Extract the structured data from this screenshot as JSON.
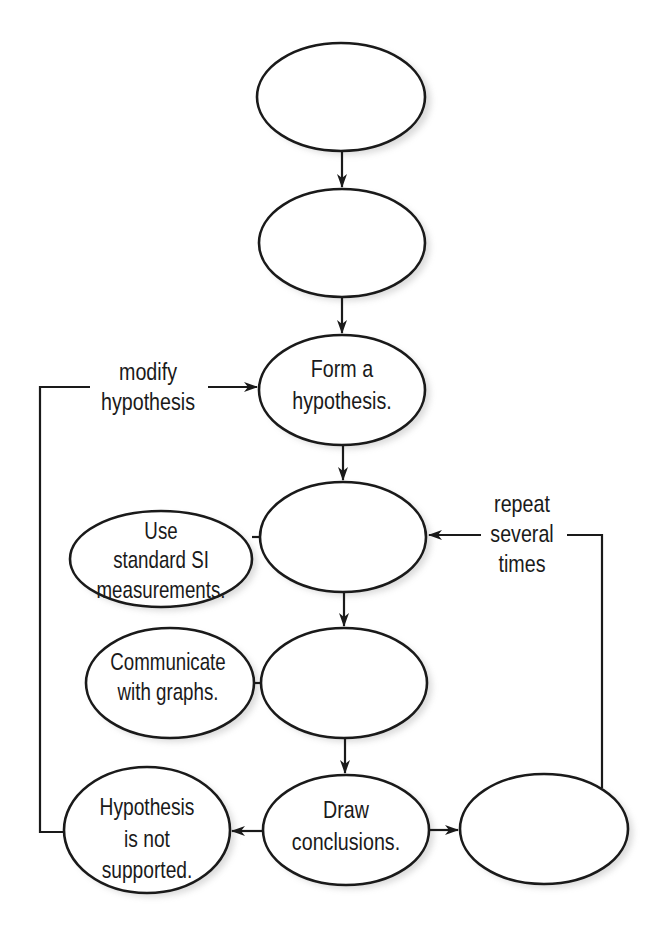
{
  "diagram": {
    "type": "flowchart",
    "colors": {
      "stroke": "#1a1a1a",
      "fill": "#ffffff",
      "background": "#ffffff"
    },
    "nodes": [
      {
        "id": "n1",
        "lines": [],
        "blank": true
      },
      {
        "id": "n2",
        "lines": [],
        "blank": true
      },
      {
        "id": "n3",
        "lines": [
          "Form a",
          "hypothesis."
        ]
      },
      {
        "id": "n4",
        "lines": [],
        "blank": true
      },
      {
        "id": "n5",
        "lines": [],
        "blank": true
      },
      {
        "id": "n6",
        "lines": [
          "Draw",
          "conclusions."
        ]
      },
      {
        "id": "n7",
        "lines": [],
        "blank": true
      },
      {
        "id": "side_si",
        "lines": [
          "Use",
          "standard SI",
          "measurements."
        ]
      },
      {
        "id": "side_graphs",
        "lines": [
          "Communicate",
          "with graphs."
        ]
      },
      {
        "id": "not_supported",
        "lines": [
          "Hypothesis",
          "is not",
          "supported."
        ]
      }
    ],
    "edge_labels": {
      "modify": [
        "modify",
        "hypothesis"
      ],
      "repeat": [
        "repeat",
        "several",
        "times"
      ]
    },
    "edges": [
      {
        "from": "n1",
        "to": "n2"
      },
      {
        "from": "n2",
        "to": "n3"
      },
      {
        "from": "n3",
        "to": "n4"
      },
      {
        "from": "n4",
        "to": "n5"
      },
      {
        "from": "n5",
        "to": "n6"
      },
      {
        "from": "n6",
        "to": "not_supported"
      },
      {
        "from": "n6",
        "to": "n7"
      },
      {
        "from": "not_supported",
        "to": "n3",
        "label": "modify hypothesis"
      },
      {
        "from": "n7",
        "to": "n4",
        "label": "repeat several times"
      },
      {
        "from": "side_si",
        "to": "n4",
        "type": "connector"
      },
      {
        "from": "side_graphs",
        "to": "n5",
        "type": "connector"
      }
    ]
  }
}
